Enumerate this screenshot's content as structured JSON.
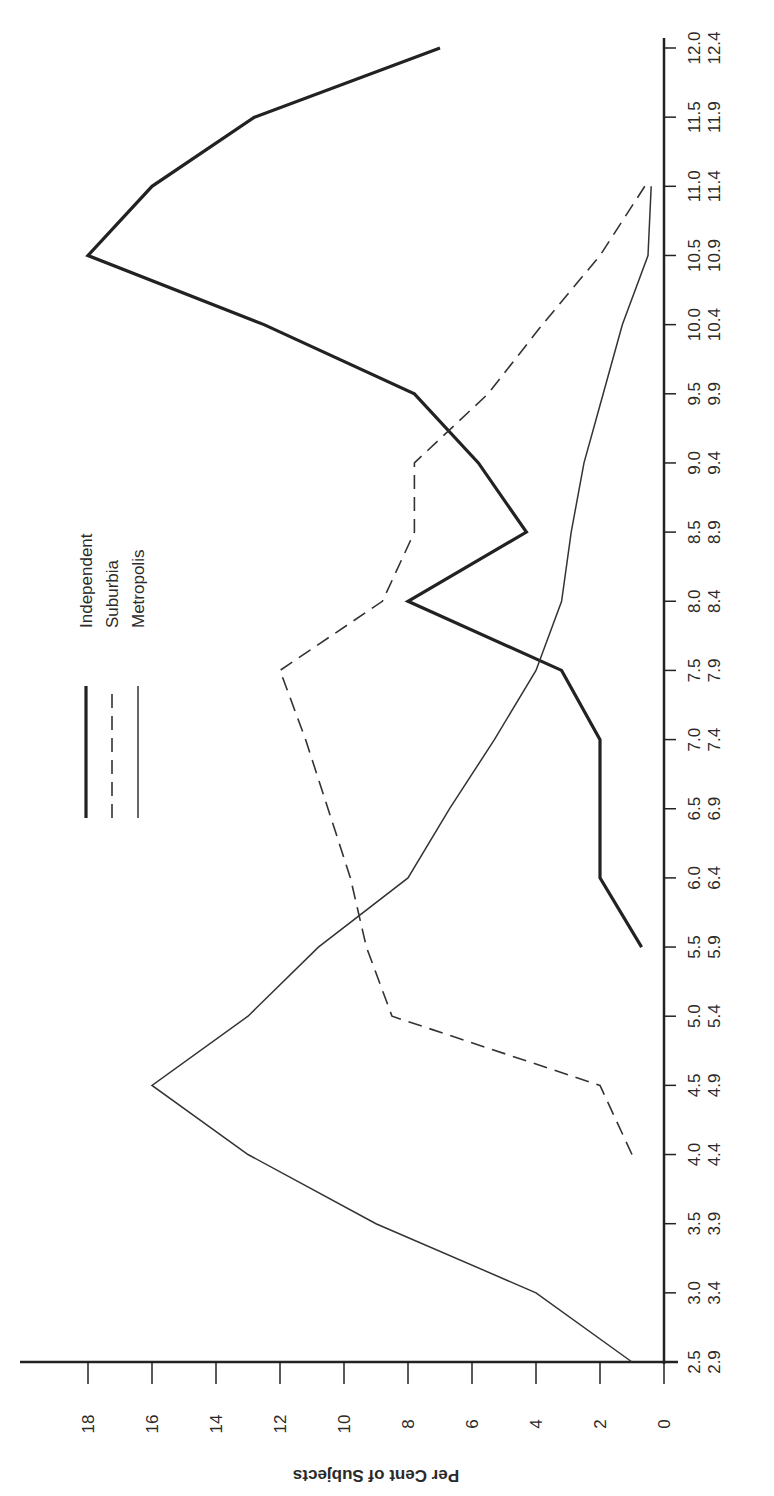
{
  "chart_data": {
    "type": "line",
    "orientation": "rotated-90-clockwise",
    "title": "",
    "xlabel": "",
    "ylabel": "Per Cent of Subjects",
    "x_tick_labels_line1": [
      "2.5",
      "3.0",
      "3.5",
      "4.0",
      "4.5",
      "5.0",
      "5.5",
      "6.0",
      "6.5",
      "7.0",
      "7.5",
      "8.0",
      "8.5",
      "9.0",
      "9.5",
      "10.0",
      "10.5",
      "11.0",
      "11.5",
      "12.0"
    ],
    "x_tick_labels_line2": [
      "2.9",
      "3.4",
      "3.9",
      "4.4",
      "4.9",
      "5.4",
      "5.9",
      "6.4",
      "6.9",
      "7.4",
      "7.9",
      "8.4",
      "8.9",
      "9.4",
      "9.9",
      "10.4",
      "10.9",
      "11.4",
      "11.9",
      "12.4"
    ],
    "y_ticks": [
      0,
      2,
      4,
      6,
      8,
      10,
      12,
      14,
      16,
      18
    ],
    "ylim": [
      0,
      19
    ],
    "grid": false,
    "legend_position": "upper-left (rotated)",
    "series": [
      {
        "name": "Independent",
        "style": "thick-solid",
        "x": [
          "5.5",
          "6.0",
          "6.5",
          "7.0",
          "7.5",
          "8.0",
          "8.5",
          "9.0",
          "9.5",
          "10.0",
          "10.5",
          "11.0",
          "11.5",
          "12.0"
        ],
        "values": [
          0.7,
          2,
          2,
          2,
          3.2,
          8,
          4.3,
          5.8,
          7.8,
          12.5,
          18,
          16,
          12.8,
          7
        ]
      },
      {
        "name": "Suburbia",
        "style": "dashed",
        "x": [
          "4.0",
          "4.5",
          "5.0",
          "5.5",
          "6.0",
          "6.5",
          "7.0",
          "7.5",
          "8.0",
          "8.5",
          "9.0",
          "9.5",
          "10.0",
          "10.5",
          "11.0"
        ],
        "values": [
          1,
          2,
          8.5,
          9.3,
          9.8,
          10.5,
          11.2,
          12,
          8.8,
          7.8,
          7.8,
          5.5,
          3.8,
          2,
          0.6
        ]
      },
      {
        "name": "Metropolis",
        "style": "thin-solid",
        "x": [
          "2.5",
          "3.0",
          "3.5",
          "4.0",
          "4.5",
          "5.0",
          "5.5",
          "6.0",
          "6.5",
          "7.0",
          "7.5",
          "8.0",
          "8.5",
          "9.0",
          "9.5",
          "10.0",
          "10.5",
          "11.0"
        ],
        "values": [
          1,
          4,
          9,
          13,
          16,
          13,
          10.8,
          8,
          6.7,
          5.3,
          4,
          3.2,
          2.9,
          2.5,
          1.9,
          1.3,
          0.5,
          0.4
        ]
      }
    ]
  },
  "legend": {
    "items": [
      {
        "label": "Independent"
      },
      {
        "label": "Suburbia"
      },
      {
        "label": "Metropolis"
      }
    ]
  }
}
